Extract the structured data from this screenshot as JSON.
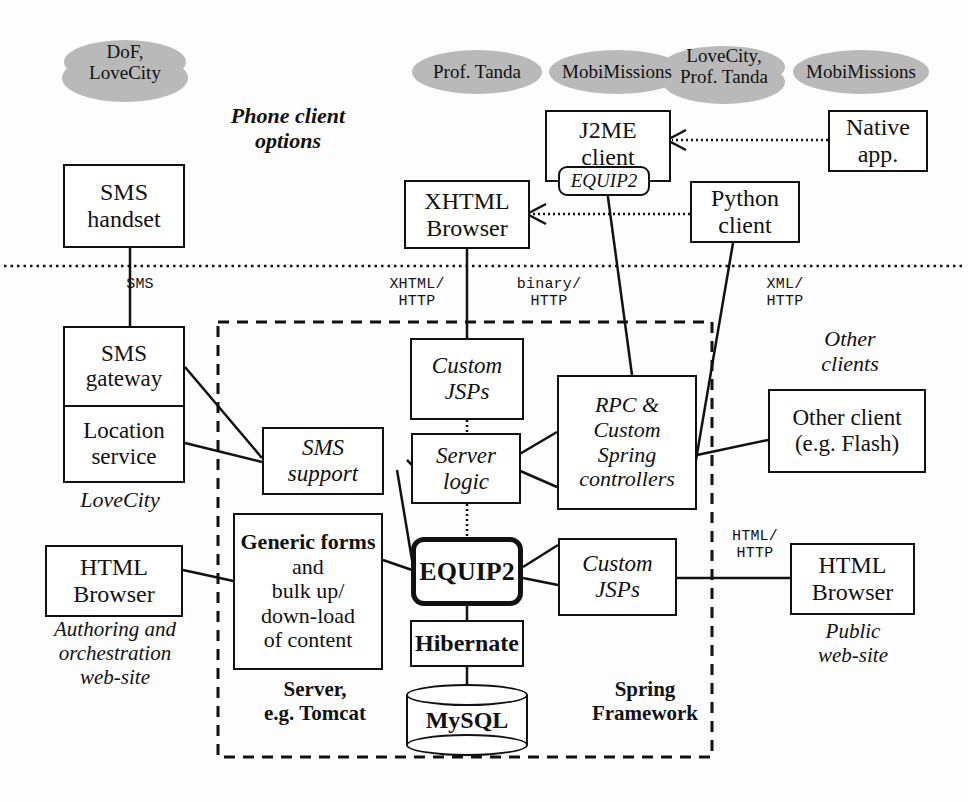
{
  "diagram": {
    "background": "#fdfdfd",
    "ink": "#111111",
    "ellipse_fill": "#b9b9b9"
  },
  "project_tags": [
    {
      "id": "tag-dof-lovecity",
      "lines": [
        "DoF,",
        "LoveCity"
      ]
    },
    {
      "id": "tag-prof-tanda",
      "lines": [
        "Prof. Tanda"
      ]
    },
    {
      "id": "tag-mobimissions-1",
      "lines": [
        "MobiMissions"
      ]
    },
    {
      "id": "tag-lovecity-tanda",
      "lines": [
        "LoveCity,",
        "Prof. Tanda"
      ]
    },
    {
      "id": "tag-mobimissions-2",
      "lines": [
        "MobiMissions"
      ]
    }
  ],
  "captions": {
    "phone_client_options": [
      "Phone client",
      "options"
    ],
    "other_clients": [
      "Other",
      "clients"
    ],
    "lovecity": [
      "LoveCity"
    ],
    "authoring": [
      "Authoring and",
      "orchestration",
      "web-site"
    ],
    "public_website": [
      "Public",
      "web-site"
    ],
    "server_tomcat": [
      "Server,",
      "e.g. Tomcat"
    ],
    "spring_framework": [
      "Spring",
      "Framework"
    ]
  },
  "nodes": {
    "sms_handset": {
      "lines": [
        "SMS",
        "handset"
      ]
    },
    "xhtml_browser": {
      "lines": [
        "XHTML",
        "Browser"
      ]
    },
    "j2me_client": {
      "lines": [
        "J2ME",
        "client"
      ]
    },
    "j2me_badge": {
      "label": "EQUIP2"
    },
    "native_app": {
      "lines": [
        "Native",
        "app."
      ]
    },
    "python_client": {
      "lines": [
        "Python",
        "client"
      ]
    },
    "sms_gateway": {
      "label": "SMS gateway",
      "lines": [
        "SMS",
        "gateway"
      ]
    },
    "location_service": {
      "label": "Location service",
      "lines": [
        "Location",
        "service"
      ]
    },
    "sms_support": {
      "lines": [
        "SMS",
        "support"
      ]
    },
    "custom_jsps_top": {
      "lines": [
        "Custom",
        "JSPs"
      ]
    },
    "server_logic": {
      "lines": [
        "Server",
        "logic"
      ]
    },
    "rpc_controllers": {
      "lines": [
        "RPC &",
        "Custom",
        "Spring",
        "controllers"
      ]
    },
    "equip2_core": {
      "label": "EQUIP2"
    },
    "custom_jsps_bottom": {
      "lines": [
        "Custom",
        "JSPs"
      ]
    },
    "generic_forms": {
      "bold_part": "Generic forms",
      "rest_lines": [
        "and",
        "bulk up/",
        "down-load",
        "of content"
      ]
    },
    "hibernate": {
      "label": "Hibernate"
    },
    "mysql": {
      "label": "MySQL"
    },
    "other_client": {
      "lines": [
        "Other client",
        "(e.g. Flash)"
      ]
    },
    "html_browser_left": {
      "lines": [
        "HTML",
        "Browser"
      ]
    },
    "html_browser_right": {
      "lines": [
        "HTML",
        "Browser"
      ]
    }
  },
  "protocol_labels": {
    "sms": [
      "SMS"
    ],
    "xhtml_http": [
      "XHTML/",
      "HTTP"
    ],
    "binary_http": [
      "binary/",
      "HTTP"
    ],
    "xml_http": [
      "XML/",
      "HTTP"
    ],
    "html_http": [
      "HTML/",
      "HTTP"
    ]
  }
}
